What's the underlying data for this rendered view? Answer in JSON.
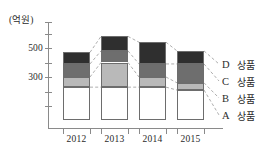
{
  "chart_data": {
    "type": "bar",
    "stacked": true,
    "title": "",
    "subtitle": "",
    "xlabel": "",
    "ylabel": "",
    "unit_label": "(억원)",
    "categories": [
      "2012",
      "2013",
      "2014",
      "2015"
    ],
    "series": [
      {
        "name": "A 상품",
        "key": "A",
        "color": "#ffffff",
        "values": [
          230,
          230,
          230,
          210
        ]
      },
      {
        "name": "B 상품",
        "key": "B",
        "color": "#b9b9b9",
        "values": [
          70,
          170,
          70,
          50
        ]
      },
      {
        "name": "C 상품",
        "key": "C",
        "color": "#6e6e6e",
        "values": [
          90,
          80,
          90,
          130
        ]
      },
      {
        "name": "D 상품",
        "key": "D",
        "color": "#2f2f2f",
        "values": [
          80,
          100,
          150,
          90
        ]
      }
    ],
    "cumulative_tops": {
      "A": [
        230,
        230,
        230,
        210
      ],
      "B": [
        300,
        400,
        300,
        260
      ],
      "C": [
        390,
        480,
        390,
        390
      ],
      "D": [
        470,
        580,
        540,
        480
      ]
    },
    "totals": [
      470,
      580,
      540,
      480
    ],
    "ytick_labels": [
      "300",
      "500"
    ],
    "ytick_values": [
      300,
      500
    ],
    "yticks_minor_step": 100,
    "ylim": [
      0,
      740
    ],
    "grid": false,
    "legend_position": "right",
    "connectors": "dashed lines linking matching segment boundaries between adjacent bars"
  },
  "legend": {
    "rows": [
      {
        "key": "D",
        "name": "상품"
      },
      {
        "key": "C",
        "name": "상품"
      },
      {
        "key": "B",
        "name": "상품"
      },
      {
        "key": "A",
        "name": "상품"
      }
    ]
  },
  "axis": {
    "unit": "(억원)",
    "y_labels": [
      "500",
      "300"
    ],
    "x_labels": [
      "2012",
      "2013",
      "2014",
      "2015"
    ]
  }
}
